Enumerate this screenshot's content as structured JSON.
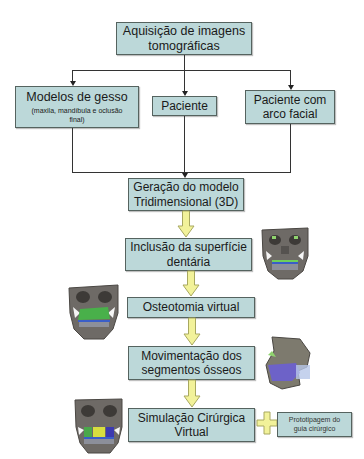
{
  "flowchart": {
    "top": {
      "line1": "Aquisição de imagens",
      "line2": "tomográficas"
    },
    "branches": [
      {
        "title": "Modelos de gesso",
        "subtitle_line1": "(maxila, mandíbula e oclusão",
        "subtitle_line2": "final)"
      },
      {
        "title": "Paciente"
      },
      {
        "line1": "Paciente com",
        "line2": "arco facial"
      }
    ],
    "steps": [
      {
        "line1": "Geração do modelo",
        "line2": "Tridimensional (3D)"
      },
      {
        "line1": "Inclusão da superfície",
        "line2": "dentária"
      },
      {
        "line1": "Osteotomia virtual"
      },
      {
        "line1": "Movimentação dos",
        "line2": "segmentos ósseos"
      },
      {
        "line1": "Simulação Cirúrgica",
        "line2": "Virtual"
      }
    ],
    "side_box": {
      "line1": "Prototipagem do",
      "line2": "guia cirúrgico"
    },
    "plus_symbol": "+",
    "images": [
      {
        "name": "skull-dental-surface",
        "desc": "3D skull frontal view with dental surface"
      },
      {
        "name": "skull-osteotomy",
        "desc": "3D skull with green maxilla osteotomy segment"
      },
      {
        "name": "skull-movement",
        "desc": "3D skull lateral view with blue moved segment"
      },
      {
        "name": "skull-simulation",
        "desc": "3D skull frontal view with colored segments"
      }
    ]
  },
  "colors": {
    "box_fill": "#bcd8d9",
    "box_border": "#55635f",
    "arrow_fill": "#f2f29a",
    "arrow_stroke": "#a8a860",
    "connector": "#333333"
  }
}
